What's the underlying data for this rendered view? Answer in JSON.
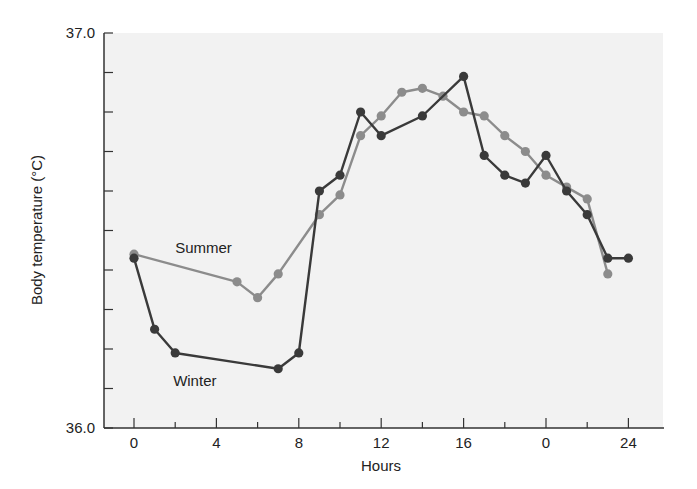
{
  "chart_data": {
    "type": "line",
    "title": "",
    "xlabel": "Hours",
    "ylabel": "Body temperature (°C)",
    "ylim": [
      36.0,
      37.0
    ],
    "y_tick_labels": [
      "36.0",
      "37.0"
    ],
    "y_minor_tick_step": 0.1,
    "x_range": [
      -1.5,
      26.0
    ],
    "x_ticks": [
      {
        "pos": 0,
        "label": "0"
      },
      {
        "pos": 2,
        "label": ""
      },
      {
        "pos": 4,
        "label": "4"
      },
      {
        "pos": 6,
        "label": ""
      },
      {
        "pos": 8,
        "label": "8"
      },
      {
        "pos": 10,
        "label": ""
      },
      {
        "pos": 12,
        "label": "12"
      },
      {
        "pos": 14,
        "label": ""
      },
      {
        "pos": 16,
        "label": "16"
      },
      {
        "pos": 18,
        "label": ""
      },
      {
        "pos": 20,
        "label": "0"
      },
      {
        "pos": 22,
        "label": ""
      },
      {
        "pos": 24,
        "label": "24"
      }
    ],
    "grid": false,
    "legend": "inline labels",
    "background": "#f2f2f2",
    "series": [
      {
        "name": "Summer",
        "color": "#8c8c8c",
        "label_pos": {
          "x": 2.0,
          "y": 36.455
        },
        "points": [
          {
            "x": 0,
            "y": 36.44
          },
          {
            "x": 5,
            "y": 36.37
          },
          {
            "x": 6,
            "y": 36.33
          },
          {
            "x": 7,
            "y": 36.39
          },
          {
            "x": 9,
            "y": 36.54
          },
          {
            "x": 10,
            "y": 36.59
          },
          {
            "x": 11,
            "y": 36.74
          },
          {
            "x": 12,
            "y": 36.79
          },
          {
            "x": 13,
            "y": 36.85
          },
          {
            "x": 14,
            "y": 36.86
          },
          {
            "x": 15,
            "y": 36.84
          },
          {
            "x": 16,
            "y": 36.8
          },
          {
            "x": 17,
            "y": 36.79
          },
          {
            "x": 18,
            "y": 36.74
          },
          {
            "x": 19,
            "y": 36.7
          },
          {
            "x": 20,
            "y": 36.64
          },
          {
            "x": 21,
            "y": 36.61
          },
          {
            "x": 22,
            "y": 36.58
          },
          {
            "x": 23,
            "y": 36.39
          }
        ]
      },
      {
        "name": "Winter",
        "color": "#3a3a3a",
        "label_pos": {
          "x": 1.9,
          "y": 36.12
        },
        "points": [
          {
            "x": 0,
            "y": 36.43
          },
          {
            "x": 1,
            "y": 36.25
          },
          {
            "x": 2,
            "y": 36.19
          },
          {
            "x": 7,
            "y": 36.15
          },
          {
            "x": 8,
            "y": 36.19
          },
          {
            "x": 9,
            "y": 36.6
          },
          {
            "x": 10,
            "y": 36.64
          },
          {
            "x": 11,
            "y": 36.8
          },
          {
            "x": 12,
            "y": 36.74
          },
          {
            "x": 14,
            "y": 36.79
          },
          {
            "x": 16,
            "y": 36.89
          },
          {
            "x": 17,
            "y": 36.69
          },
          {
            "x": 18,
            "y": 36.64
          },
          {
            "x": 19,
            "y": 36.62
          },
          {
            "x": 20,
            "y": 36.69
          },
          {
            "x": 21,
            "y": 36.6
          },
          {
            "x": 22,
            "y": 36.54
          },
          {
            "x": 23,
            "y": 36.43
          },
          {
            "x": 24,
            "y": 36.43
          }
        ]
      }
    ]
  }
}
